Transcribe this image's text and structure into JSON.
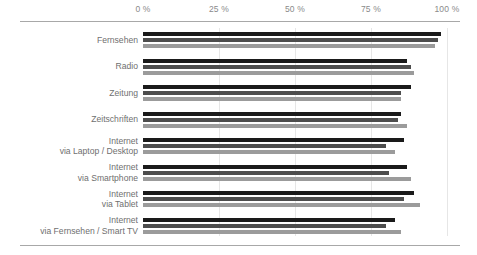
{
  "chart_data": {
    "type": "bar",
    "orientation": "horizontal",
    "title": "",
    "xlabel": "",
    "ylabel": "",
    "xlim": [
      0,
      100
    ],
    "grid": true,
    "legend_position": "none",
    "tick_labels": [
      "0 %",
      "25 %",
      "50 %",
      "75 %",
      "100 %"
    ],
    "ticks": [
      0,
      25,
      50,
      75,
      100
    ],
    "categories": [
      "Fernsehen",
      "Radio",
      "Zeitung",
      "Zeitschriften",
      "Internet\nvia Laptop / Desktop",
      "Internet\nvia Smartphone",
      "Internet\nvia Tablet",
      "Internet\nvia Fernsehen / Smart TV"
    ],
    "series": [
      {
        "name": "series-1",
        "color": "#1a1a1a",
        "values": [
          98,
          87,
          88,
          85,
          86,
          87,
          89,
          83
        ]
      },
      {
        "name": "series-2",
        "color": "#4d4d4d",
        "values": [
          97,
          88,
          85,
          84,
          80,
          81,
          86,
          80
        ]
      },
      {
        "name": "series-3",
        "color": "#9b9b9b",
        "values": [
          96,
          89,
          85,
          87,
          83,
          88,
          91,
          85
        ]
      }
    ]
  }
}
